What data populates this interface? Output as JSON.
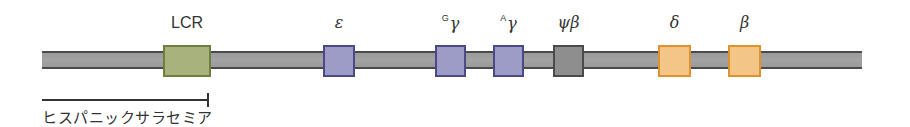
{
  "diagram": {
    "type": "gene-locus",
    "chromosome_bar": {
      "x_start": 42,
      "x_end": 862,
      "color": "#9a9a9a",
      "edge_color": "#4a4a4a"
    },
    "genes": [
      {
        "id": "lcr",
        "prefix": "",
        "label": "LCR",
        "x": 163,
        "width": 44,
        "fill": "#a7b27c",
        "border": "#6f7d3e",
        "greek": false
      },
      {
        "id": "epsilon",
        "prefix": "",
        "label": "ε",
        "x": 323,
        "width": 28,
        "fill": "#9c9cc6",
        "border": "#4a4a86",
        "greek": true
      },
      {
        "id": "g-gamma",
        "prefix": "G",
        "label": "γ",
        "x": 435,
        "width": 27,
        "fill": "#9c9cc6",
        "border": "#4a4a86",
        "greek": true
      },
      {
        "id": "a-gamma",
        "prefix": "A",
        "label": "γ",
        "x": 493,
        "width": 27,
        "fill": "#9c9cc6",
        "border": "#4a4a86",
        "greek": true
      },
      {
        "id": "psi-beta",
        "prefix": "",
        "label": "ψβ",
        "x": 553,
        "width": 27,
        "fill": "#8e8e8e",
        "border": "#4a4a4a",
        "greek": true
      },
      {
        "id": "delta",
        "prefix": "",
        "label": "δ",
        "x": 658,
        "width": 29,
        "fill": "#f3c587",
        "border": "#e0922e",
        "greek": true
      },
      {
        "id": "beta",
        "prefix": "",
        "label": "β",
        "x": 728,
        "width": 29,
        "fill": "#f3c587",
        "border": "#e0922e",
        "greek": true
      }
    ],
    "deletion": {
      "label": "ヒスパニックサラセミア",
      "x_start": 42,
      "x_end": 208
    }
  }
}
